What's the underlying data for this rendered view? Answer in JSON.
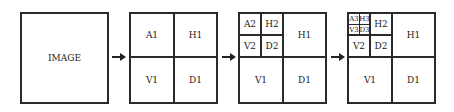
{
  "diagram": {
    "type": "wavelet-decomposition",
    "stages": [
      {
        "label": "IMAGE"
      },
      {
        "level": 1,
        "cells": [
          "A1",
          "H1",
          "V1",
          "D1"
        ]
      },
      {
        "level": 2,
        "cells": [
          "A2",
          "H2",
          "V2",
          "D2",
          "H1",
          "V1",
          "D1"
        ]
      },
      {
        "level": 3,
        "cells": [
          "A3",
          "H3",
          "V3",
          "D3",
          "H2",
          "V2",
          "D2",
          "H1",
          "V1",
          "D1"
        ]
      }
    ],
    "labels": {
      "image": "IMAGE",
      "A1": "A1",
      "H1": "H1",
      "V1": "V1",
      "D1": "D1",
      "A2": "A2",
      "H2": "H2",
      "V2": "V2",
      "D2": "D2",
      "A3": "A3",
      "H3": "H3",
      "V3": "V3",
      "D3": "D3"
    },
    "arrow_count": 3,
    "line_color": "#2a2a2a"
  }
}
